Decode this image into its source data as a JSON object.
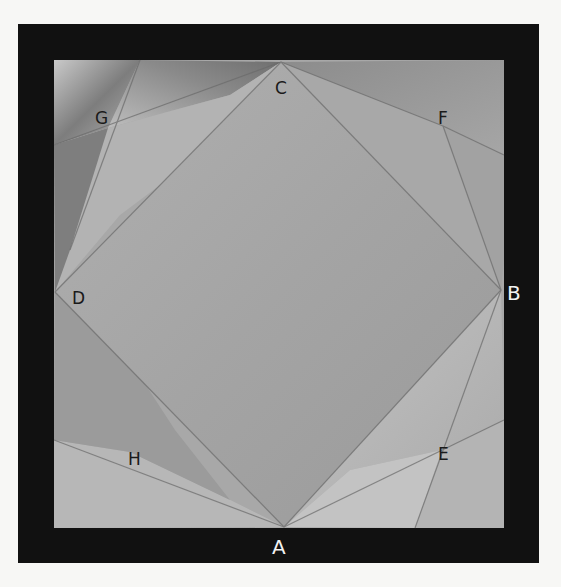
{
  "figure": {
    "frame_color": "#111111",
    "paper_color": "#a9a9a9",
    "background_color": "#f7f7f5",
    "labels": {
      "A": "A",
      "B": "B",
      "C": "C",
      "D": "D",
      "E": "E",
      "F": "F",
      "G": "G",
      "H": "H"
    },
    "points": {
      "A": [
        284,
        527
      ],
      "B": [
        501,
        290
      ],
      "C": [
        281,
        62
      ],
      "D": [
        55,
        292
      ],
      "E": [
        442,
        450
      ],
      "F": [
        443,
        126
      ],
      "G": [
        100,
        118
      ],
      "H": [
        130,
        452
      ]
    }
  }
}
